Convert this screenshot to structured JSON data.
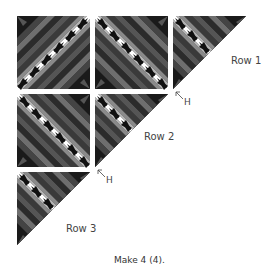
{
  "diagram": {
    "rows": [
      {
        "label": "Row 1",
        "blocks": [
          "square",
          "square",
          "triangle"
        ]
      },
      {
        "label": "Row 2",
        "blocks": [
          "square",
          "triangle"
        ]
      },
      {
        "label": "Row 3",
        "blocks": [
          "triangle"
        ]
      }
    ],
    "h_markers": [
      {
        "label": "H",
        "position": "row1-row2"
      },
      {
        "label": "H",
        "position": "row2-row3"
      }
    ],
    "caption": "Make 4 (4).",
    "colors": {
      "black": "#111111",
      "dark_gray": "#3a3a3a",
      "mid_gray": "#6e6e6e",
      "light_gray": "#a8a8a8",
      "white": "#ffffff"
    }
  }
}
